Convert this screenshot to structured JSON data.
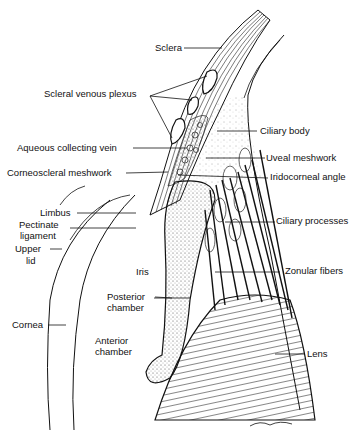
{
  "diagram": {
    "labels": {
      "sclera": "Sclera",
      "scleral_venous_plexus": "Scleral venous plexus",
      "ciliary_body": "Ciliary body",
      "aqueous_collecting_vein": "Aqueous collecting vein",
      "uveal_meshwork": "Uveal meshwork",
      "corneoscleral_meshwork": "Corneoscleral meshwork",
      "iridocorneal_angle": "Iridocorneal angle",
      "limbus": "Limbus",
      "pectinate_ligament_1": "Pectinate",
      "pectinate_ligament_2": "ligament",
      "ciliary_processes": "Ciliary processes",
      "upper_lid_1": "Upper",
      "upper_lid_2": "lid",
      "iris": "Iris",
      "zonular_fibers": "Zonular fibers",
      "posterior_chamber_1": "Posterior",
      "posterior_chamber_2": "chamber",
      "cornea": "Cornea",
      "anterior_chamber_1": "Anterior",
      "anterior_chamber_2": "chamber",
      "lens": "Lens"
    }
  }
}
